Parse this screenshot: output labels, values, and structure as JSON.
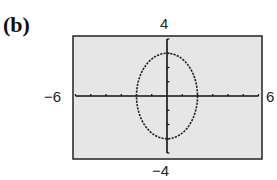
{
  "panel_label": "(b)",
  "labels": {
    "ymax": "4",
    "ymin": "−4",
    "xmin": "−6",
    "xmax": "6"
  },
  "colors": {
    "screen_bg": "#e6e6e6",
    "frame": "#222222",
    "axis": "#111111",
    "curve": "#222222"
  },
  "chart_data": {
    "type": "line",
    "title": "(b)",
    "xlabel": "",
    "ylabel": "",
    "xlim": [
      -6,
      6
    ],
    "ylim": [
      -4,
      4
    ],
    "x_ticks": [
      -6,
      -5,
      -4,
      -3,
      -2,
      -1,
      0,
      1,
      2,
      3,
      4,
      5,
      6
    ],
    "y_ticks": [
      -4,
      -3,
      -2,
      -1,
      0,
      1,
      2,
      3,
      4
    ],
    "tick_labels": {
      "x": [
        "-6",
        "6"
      ],
      "y": [
        "-4",
        "4"
      ]
    },
    "grid": false,
    "series": [
      {
        "name": "ellipse",
        "equation": "x^2/4 + y^2/9 = 1",
        "center": [
          0,
          0
        ],
        "semi_axis_x": 2,
        "semi_axis_y": 3,
        "points": [
          [
            2,
            0
          ],
          [
            1.73,
            1.5
          ],
          [
            1,
            2.6
          ],
          [
            0,
            3
          ],
          [
            -1,
            2.6
          ],
          [
            -1.73,
            1.5
          ],
          [
            -2,
            0
          ],
          [
            -1.73,
            -1.5
          ],
          [
            -1,
            -2.6
          ],
          [
            0,
            -3
          ],
          [
            1,
            -2.6
          ],
          [
            1.73,
            -1.5
          ],
          [
            2,
            0
          ]
        ]
      }
    ]
  }
}
